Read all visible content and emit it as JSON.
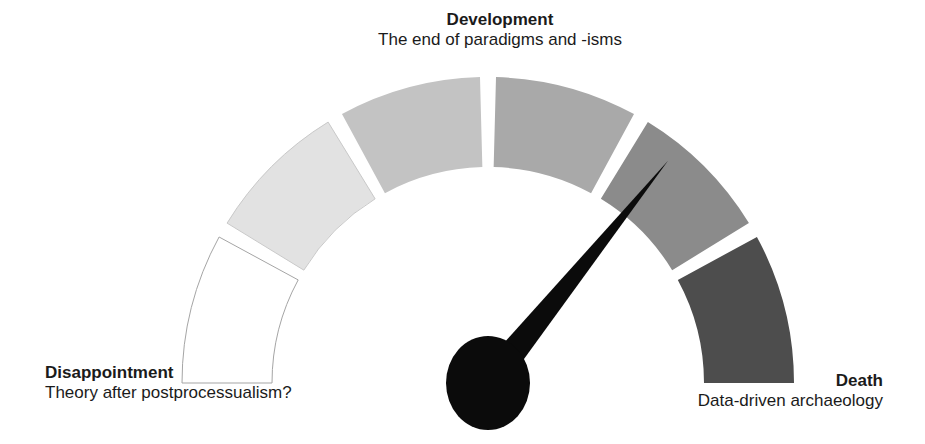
{
  "background": "#ffffff",
  "text_color": "#1b1b1b",
  "labels": {
    "top": {
      "title": "Development",
      "subtitle": "The end of paradigms and -isms"
    },
    "left": {
      "title": "Disappointment",
      "subtitle": "Theory after postprocessualism?"
    },
    "right": {
      "title": "Death",
      "subtitle": "Data-driven archaeology"
    }
  },
  "gauge": {
    "center_x": 488,
    "center_y": 383,
    "outer_radius": 306,
    "inner_radius": 216,
    "start_angle_deg": 180,
    "end_angle_deg": 0,
    "gap_deg": 3,
    "segments": [
      {
        "name": "segment-1-disappointment",
        "fill": "#ffffff",
        "stroke": "#a5a5a5"
      },
      {
        "name": "segment-2",
        "fill": "#e2e2e2",
        "stroke": "#c9c9c9"
      },
      {
        "name": "segment-3",
        "fill": "#c3c3c3",
        "stroke": "none"
      },
      {
        "name": "segment-4",
        "fill": "#a9a9a9",
        "stroke": "none"
      },
      {
        "name": "segment-5",
        "fill": "#8b8b8b",
        "stroke": "none"
      },
      {
        "name": "segment-6-death",
        "fill": "#4d4d4d",
        "stroke": "none"
      }
    ],
    "needle": {
      "angle_deg": 51,
      "length": 286,
      "base_half_width": 15,
      "color": "#0b0b0b"
    },
    "hub": {
      "rx": 42,
      "ry": 47,
      "color": "#0b0b0b"
    }
  }
}
